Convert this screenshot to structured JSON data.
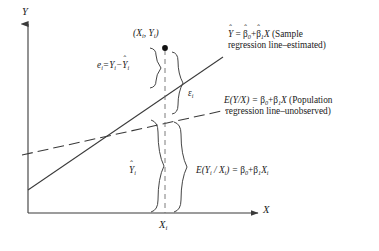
{
  "figure": {
    "type": "scatter-diagram",
    "background": "#ffffff",
    "ink_color": "#3a3a3a",
    "axes": {
      "y_label": "Y",
      "x_label": "X",
      "x_tick_label": "X",
      "x_tick_subscript": "i",
      "origin": [
        28,
        213
      ]
    },
    "point": {
      "label_open": "(",
      "label_x": "X",
      "label_sub": "i",
      "label_sep": ", ",
      "label_y": "Y",
      "label_close": ")",
      "x": 165,
      "y": 48
    },
    "lines": [
      {
        "name": "sample-regression-line",
        "style": "solid",
        "from": [
          28,
          190
        ],
        "to": [
          223,
          57
        ],
        "label_line1_prefix": "Y",
        "label_line1": " = ",
        "beta0": "β",
        "beta0_sub": "0",
        "plus": "+",
        "beta1": "β",
        "beta1_sub": "1",
        "var": "X",
        "label_tail": " (Sample",
        "label_line2": "regression line–estimated)",
        "hat": "ˆ"
      },
      {
        "name": "population-regression-line",
        "style": "dashed",
        "from": [
          22,
          155
        ],
        "to": [
          226,
          110
        ],
        "label_line1": "E(Y/X) = ",
        "beta0": "β",
        "beta0_sub": "0",
        "plus": "+",
        "beta1": "β",
        "beta1_sub": "1",
        "var": "X",
        "label_tail": " (Population",
        "label_line2": "regression line–unobserved)"
      }
    ],
    "annotations": {
      "residual": {
        "name": "residual-e-i",
        "text_e": "e",
        "sub_i": "i",
        "eq": "=",
        "text_Y": "Y",
        "minus": "−",
        "text_Yhat": "Y",
        "hat": "ˆ"
      },
      "error": {
        "name": "error-epsilon-i",
        "symbol": "ε",
        "sub": "i"
      },
      "fitted": {
        "name": "fitted-Y-hat-i",
        "symbol": "Y",
        "hat": "ˆ",
        "sub": "i"
      },
      "conditional_mean": {
        "name": "conditional-mean-equation",
        "lead": "E(Y",
        "sub1": "i",
        "slash": " / X",
        "sub2": "i",
        "close": ") = ",
        "beta0": "β",
        "beta0_sub": "0",
        "plus": "+",
        "beta1": "β",
        "beta1_sub": "1",
        "var": "X",
        "var_sub": "i"
      }
    }
  }
}
